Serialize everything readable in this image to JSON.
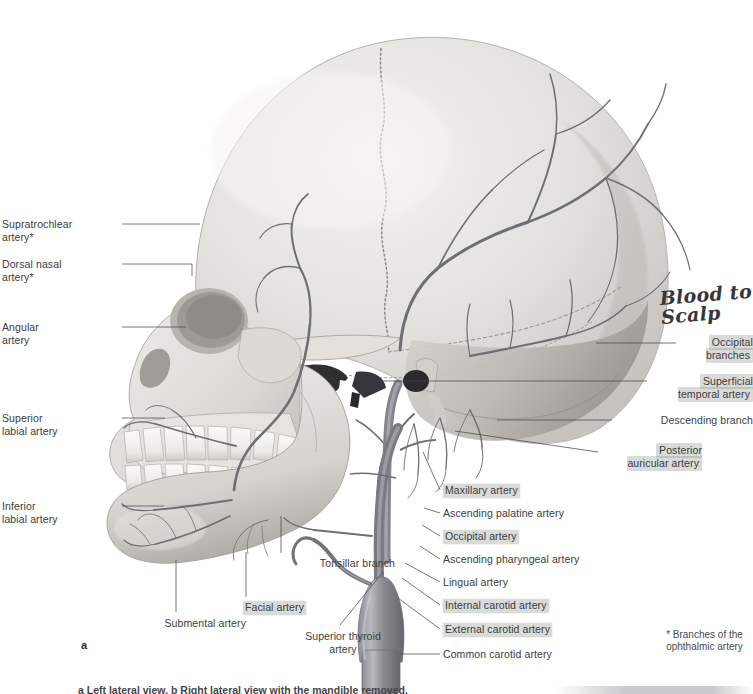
{
  "figure": {
    "panel_letter": "a",
    "footnote": "* Branches of the\nophthalmic artery",
    "handwritten_note": "Blood to\nScalp",
    "caption_partial": "a Left lateral view. b Right lateral view with the mandible removed."
  },
  "labels_left": [
    {
      "id": "supratrochlear-artery",
      "text": "Supratrochlear\nartery*",
      "x": 2,
      "y": 218,
      "w": 117,
      "align": "right",
      "highlight": false
    },
    {
      "id": "dorsal-nasal-artery",
      "text": "Dorsal nasal\nartery*",
      "x": 2,
      "y": 258,
      "w": 117,
      "align": "right",
      "highlight": false
    },
    {
      "id": "angular-artery",
      "text": "Angular\nartery",
      "x": 2,
      "y": 321,
      "w": 117,
      "align": "right",
      "highlight": false
    },
    {
      "id": "superior-labial-artery",
      "text": "Superior\nlabial artery",
      "x": 2,
      "y": 412,
      "w": 117,
      "align": "right",
      "highlight": false
    },
    {
      "id": "inferior-labial-artery",
      "text": "Inferior\nlabial artery",
      "x": 2,
      "y": 500,
      "w": 117,
      "align": "right",
      "highlight": false
    }
  ],
  "labels_bottom_left": [
    {
      "id": "submental-artery",
      "text": "Submental artery",
      "x": 126,
      "y": 617,
      "w": 120,
      "align": "left",
      "highlight": false
    },
    {
      "id": "facial-artery",
      "text": "Facial artery",
      "x": 216,
      "y": 601,
      "w": 90,
      "align": "left",
      "highlight": true
    },
    {
      "id": "tonsillar-branch",
      "text": "Tonsillar branch",
      "x": 285,
      "y": 557,
      "w": 110,
      "align": "left",
      "highlight": false
    },
    {
      "id": "superior-thyroid-artery",
      "text": "Superior thyroid\nartery",
      "x": 288,
      "y": 630,
      "w": 110,
      "align": "center",
      "highlight": false
    }
  ],
  "labels_right_upper": [
    {
      "id": "occipital-branches",
      "text": "Occipital\nbranches",
      "x": 680,
      "y": 336,
      "w": 73,
      "highlight": true
    },
    {
      "id": "superficial-temporal-artery",
      "text": "Superficial\ntemporal artery",
      "x": 651,
      "y": 375,
      "w": 102,
      "highlight": true
    },
    {
      "id": "descending-branch",
      "text": "Descending branch",
      "x": 616,
      "y": 414,
      "w": 137,
      "highlight": false
    },
    {
      "id": "posterior-auricular-artery",
      "text": "Posterior\nauricular artery",
      "x": 602,
      "y": 444,
      "w": 100,
      "highlight": true
    }
  ],
  "labels_right_lower": [
    {
      "id": "maxillary-artery",
      "text": "Maxillary artery",
      "x": 443,
      "y": 484,
      "highlight": true
    },
    {
      "id": "ascending-palatine-artery",
      "text": "Ascending palatine artery",
      "x": 443,
      "y": 507,
      "highlight": false
    },
    {
      "id": "occipital-artery",
      "text": "Occipital artery",
      "x": 443,
      "y": 530,
      "highlight": true
    },
    {
      "id": "ascending-pharyngeal-artery",
      "text": "Ascending pharyngeal artery",
      "x": 443,
      "y": 553,
      "highlight": false
    },
    {
      "id": "lingual-artery",
      "text": "Lingual artery",
      "x": 443,
      "y": 576,
      "highlight": false
    },
    {
      "id": "internal-carotid-artery",
      "text": "Internal carotid artery",
      "x": 443,
      "y": 599,
      "highlight": true
    },
    {
      "id": "external-carotid-artery",
      "text": "External carotid artery",
      "x": 443,
      "y": 623,
      "highlight": true
    },
    {
      "id": "common-carotid-artery",
      "text": "Common carotid artery",
      "x": 443,
      "y": 648,
      "highlight": false
    }
  ],
  "leader_lines": [
    {
      "id": "ll-supratrochlear",
      "d": "M122,224 L200,224"
    },
    {
      "id": "ll-dorsal-nasal",
      "d": "M122,264 L192,264 L192,276"
    },
    {
      "id": "ll-angular",
      "d": "M122,327 L186,327"
    },
    {
      "id": "ll-superior-labial",
      "d": "M122,418 L165,418"
    },
    {
      "id": "ll-inferior-labial",
      "d": "M122,506 L164,506"
    },
    {
      "id": "ll-submental",
      "d": "M176,612 L176,560"
    },
    {
      "id": "ll-facial",
      "d": "M246,597 L246,552"
    },
    {
      "id": "ll-tonsillar",
      "d": "M281,553 L281,516"
    },
    {
      "id": "ll-sup-thyroid",
      "d": "M340,625 L383,572"
    },
    {
      "id": "ll-occipital-branch",
      "d": "M676,343 L596,343"
    },
    {
      "id": "ll-sup-temporal",
      "d": "M647,381 L378,381"
    },
    {
      "id": "ll-descending",
      "d": "M612,420 L497,420"
    },
    {
      "id": "ll-post-auricular",
      "d": "M598,452 L455,431"
    },
    {
      "id": "ll-maxillary",
      "d": "M440,490 L423,452"
    },
    {
      "id": "ll-asc-palatine",
      "d": "M440,513 L424,508"
    },
    {
      "id": "ll-occipital-art",
      "d": "M440,536 L422,525"
    },
    {
      "id": "ll-asc-pharyngeal",
      "d": "M440,559 L420,546"
    },
    {
      "id": "ll-lingual",
      "d": "M440,582 L405,563"
    },
    {
      "id": "ll-internal-carotid",
      "d": "M440,605 L402,578"
    },
    {
      "id": "ll-external-carotid",
      "d": "M440,629 L398,598"
    },
    {
      "id": "ll-common-carotid",
      "d": "M440,654 L400,654"
    }
  ],
  "colors": {
    "artery": "#6e6f74",
    "bone_light": "#eceae8",
    "bone_mid": "#cfccc8",
    "bone_shadow": "#a7a4a1",
    "label_text": "#3b3b3d",
    "highlight": "#8c928c",
    "leader_line": "#4a4a4c",
    "handwriting": "#35353a"
  }
}
